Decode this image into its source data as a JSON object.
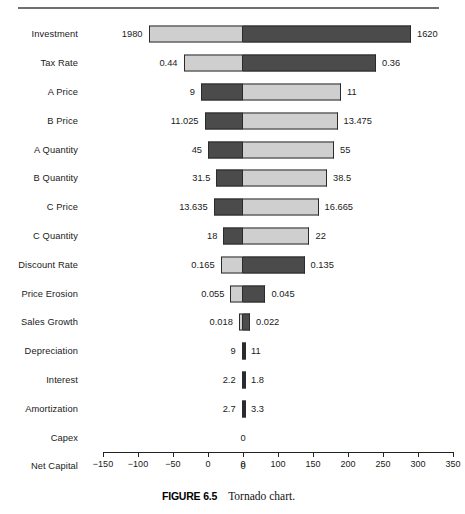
{
  "figure": {
    "number_label": "FIGURE 6.5",
    "caption": "Tornado chart."
  },
  "chart_data": {
    "type": "bar",
    "subtype": "tornado",
    "title": "Tornado chart",
    "xlabel": "",
    "ylabel": "",
    "grid": false,
    "legend": "none",
    "orientation": "horizontal",
    "base_value": 50,
    "axis": {
      "ticks": [
        -150,
        -100,
        -50,
        0,
        0,
        100,
        150,
        200,
        250,
        300,
        350
      ],
      "tick_labels": [
        "−150",
        "−100",
        "−50",
        "0",
        "0",
        "100",
        "150",
        "200",
        "250",
        "300",
        "350"
      ],
      "xlim": [
        -150,
        350
      ],
      "note_second_zero_is_mislabeled_50": true
    },
    "categories": [
      "Investment",
      "Tax Rate",
      "A Price",
      "B Price",
      "A Quantity",
      "B Quantity",
      "C Price",
      "C Quantity",
      "Discount Rate",
      "Price Erosion",
      "Sales Growth",
      "Depreciation",
      "Interest",
      "Amortization",
      "Capex",
      "Net Capital"
    ],
    "rows": [
      {
        "label": "Investment",
        "left_label": "1980",
        "right_label": "1620",
        "low_x": -85,
        "high_x": 290,
        "left_color": "light",
        "right_color": "dark"
      },
      {
        "label": "Tax Rate",
        "left_label": "0.44",
        "right_label": "0.36",
        "low_x": -35,
        "high_x": 240,
        "left_color": "light",
        "right_color": "dark"
      },
      {
        "label": "A Price",
        "left_label": "9",
        "right_label": "11",
        "low_x": -10,
        "high_x": 190,
        "left_color": "dark",
        "right_color": "light"
      },
      {
        "label": "B Price",
        "left_label": "11.025",
        "right_label": "13.475",
        "low_x": -5,
        "high_x": 185,
        "left_color": "dark",
        "right_color": "light"
      },
      {
        "label": "A Quantity",
        "left_label": "45",
        "right_label": "55",
        "low_x": 0,
        "high_x": 180,
        "left_color": "dark",
        "right_color": "light"
      },
      {
        "label": "B Quantity",
        "left_label": "31.5",
        "right_label": "38.5",
        "low_x": 12,
        "high_x": 170,
        "left_color": "dark",
        "right_color": "light"
      },
      {
        "label": "C Price",
        "left_label": "13.635",
        "right_label": "16.665",
        "low_x": 8,
        "high_x": 158,
        "left_color": "dark",
        "right_color": "light"
      },
      {
        "label": "C Quantity",
        "left_label": "18",
        "right_label": "22",
        "low_x": 22,
        "high_x": 145,
        "left_color": "dark",
        "right_color": "light"
      },
      {
        "label": "Discount Rate",
        "left_label": "0.165",
        "right_label": "0.135",
        "low_x": 18,
        "high_x": 138,
        "left_color": "light",
        "right_color": "dark"
      },
      {
        "label": "Price Erosion",
        "left_label": "0.055",
        "right_label": "0.045",
        "low_x": 32,
        "high_x": 82,
        "left_color": "light",
        "right_color": "dark"
      },
      {
        "label": "Sales Growth",
        "left_label": "0.018",
        "right_label": "0.022",
        "low_x": 44,
        "high_x": 60,
        "left_color": "light",
        "right_color": "dark"
      },
      {
        "label": "Depreciation",
        "left_label": "9",
        "right_label": "11",
        "low_x": 48,
        "high_x": 53,
        "left_color": "dark",
        "right_color": "dark"
      },
      {
        "label": "Interest",
        "left_label": "2.2",
        "right_label": "1.8",
        "low_x": 48,
        "high_x": 53,
        "left_color": "dark",
        "right_color": "dark"
      },
      {
        "label": "Amortization",
        "left_label": "2.7",
        "right_label": "3.3",
        "low_x": 48,
        "high_x": 53,
        "left_color": "dark",
        "right_color": "dark"
      },
      {
        "label": "Capex",
        "center_label": "0",
        "low_x": 50,
        "high_x": 50,
        "left_color": "none",
        "right_color": "none"
      },
      {
        "label": "Net Capital",
        "center_label": "0",
        "low_x": 50,
        "high_x": 50,
        "left_color": "none",
        "right_color": "none"
      }
    ],
    "colors": {
      "light_segment": "#cfcfcf",
      "dark_segment": "#4b4b4b",
      "border": "#2b2b2b",
      "text": "#1a1a1a",
      "rule": "#6f6f6f"
    }
  }
}
